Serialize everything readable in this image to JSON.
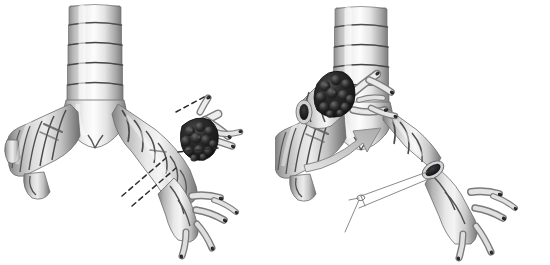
{
  "figure": {
    "title": "Bronchial sleeve resection of an endobronchial tumour",
    "background_color": "#ffffff",
    "width": 550,
    "height": 265,
    "panel_count": 2,
    "has_text_labels": false,
    "modality": "3D rendered medical illustration, grayscale"
  },
  "palette": {
    "background": "#ffffff",
    "cartilage_light": "#fbfbfb",
    "cartilage_mid": "#d8d8d8",
    "cartilage_shadow": "#8f8f8f",
    "ring_groove": "#4a4a4a",
    "outline": "#5a5a5a",
    "lumen_dark": "#17181a",
    "tumor_dark": "#161616",
    "tumor_lobule_highlight": "#4a4a4a",
    "arrow_fill": "#cfcfcf",
    "arrow_stroke": "#8a8a8a",
    "dashed_line": "#2b2b2b",
    "suture_thread": "#7d7d7d"
  },
  "panels": [
    {
      "id": "panel-before",
      "name": "pre-resection",
      "order": 1,
      "caption": "",
      "structures": [
        {
          "name": "trachea",
          "description": "vertical airway with cartilage rings",
          "ring_count": 5
        },
        {
          "name": "carina",
          "description": "tracheal bifurcation notch"
        },
        {
          "name": "left-main-bronchus",
          "description": "angles inferolaterally to the left",
          "ring_count": 6
        },
        {
          "name": "right-main-bronchus",
          "description": "angles inferolaterally to the right",
          "ring_count": 7
        },
        {
          "name": "right-upper-lobe-branch",
          "description": "segmental branches arising near tumour"
        },
        {
          "name": "distal-bronchial-tree",
          "description": "lower segmental branches with open lumina"
        },
        {
          "name": "endobronchial-tumour",
          "description": "dark lobulated mass at right bronchial branch origin"
        },
        {
          "name": "resection-lines",
          "description": "two dashed lines marking proximal and distal cut margins",
          "style": "dashed"
        }
      ]
    },
    {
      "id": "panel-after",
      "name": "post-resection-with-specimen",
      "order": 2,
      "caption": "",
      "structures": [
        {
          "name": "trachea",
          "description": "vertical airway with cartilage rings",
          "ring_count": 5
        },
        {
          "name": "carina",
          "description": "tracheal bifurcation notch"
        },
        {
          "name": "left-main-bronchus",
          "description": "angles inferolaterally to the left",
          "ring_count": 6
        },
        {
          "name": "right-main-bronchus-stump",
          "description": "proximal stump after sleeve excision"
        },
        {
          "name": "distal-bronchial-segment",
          "description": "distal airway with open cut lumen awaiting anastomosis"
        },
        {
          "name": "cut-lumen-opening",
          "description": "dark elliptical open bronchial lumen at cut end"
        },
        {
          "name": "excised-specimen",
          "description": "resected bronchial sleeve bearing the tumour, displaced superolaterally"
        },
        {
          "name": "transfer-arrow",
          "description": "curved arrow indicating removal of specimen",
          "direction": "up-right"
        },
        {
          "name": "anastomosis-sutures",
          "description": "fine suture threads with knot, prepared for reconstruction",
          "thread_count": 4
        }
      ]
    }
  ]
}
